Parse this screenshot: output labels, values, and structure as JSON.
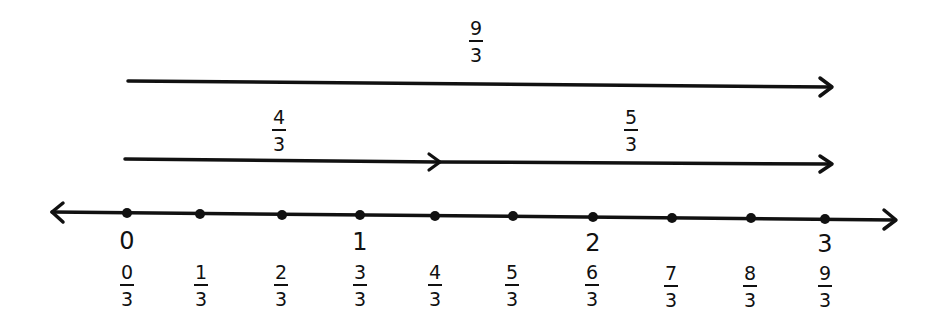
{
  "diagram": {
    "title": "",
    "whole_labels": [
      {
        "label": "0",
        "x": 127
      },
      {
        "label": "1",
        "x": 360
      },
      {
        "label": "2",
        "x": 593
      },
      {
        "label": "3",
        "x": 825
      }
    ],
    "points": [
      {
        "num": "0",
        "den": "3",
        "x": 127,
        "y": 213
      },
      {
        "num": "1",
        "den": "3",
        "x": 200,
        "y": 214
      },
      {
        "num": "2",
        "den": "3",
        "x": 282,
        "y": 215
      },
      {
        "num": "3",
        "den": "3",
        "x": 360,
        "y": 215
      },
      {
        "num": "4",
        "den": "3",
        "x": 435,
        "y": 216
      },
      {
        "num": "5",
        "den": "3",
        "x": 513,
        "y": 216
      },
      {
        "num": "6",
        "den": "3",
        "x": 593,
        "y": 217
      },
      {
        "num": "7",
        "den": "3",
        "x": 672,
        "y": 218
      },
      {
        "num": "8",
        "den": "3",
        "x": 751,
        "y": 218
      },
      {
        "num": "9",
        "den": "3",
        "x": 825,
        "y": 219
      }
    ],
    "jump_arrows": [
      {
        "label_num": "9",
        "label_den": "3",
        "from": 127,
        "to": 832,
        "row": "top"
      },
      {
        "label_num": "4",
        "label_den": "3",
        "from": 125,
        "to": 440,
        "row": "middle"
      },
      {
        "label_num": "5",
        "label_den": "3",
        "from": 440,
        "to": 832,
        "row": "middle"
      }
    ],
    "stroke_color": "#111111",
    "background_color": "#ffffff"
  }
}
